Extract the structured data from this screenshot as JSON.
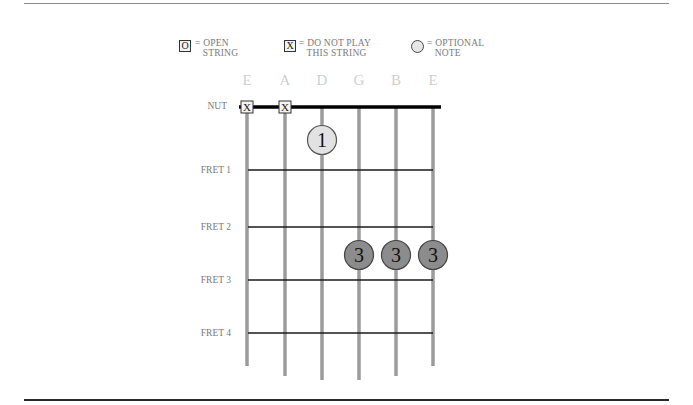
{
  "legend": {
    "open": {
      "symbol": "O",
      "text": "= OPEN\n   STRING"
    },
    "mute": {
      "symbol": "X",
      "text": "= DO NOT PLAY\n   THIS STRING"
    },
    "optional": {
      "symbol": "circle",
      "text": "= OPTIONAL\n   NOTE"
    }
  },
  "strings": [
    "E",
    "A",
    "D",
    "G",
    "B",
    "E"
  ],
  "nut_label": "NUT",
  "fret_labels": [
    "FRET 1",
    "FRET 2",
    "FRET 3",
    "FRET 4"
  ],
  "muted_strings": [
    0,
    1
  ],
  "muted_symbol": "X",
  "notes": [
    {
      "string": 2,
      "position": "between nut and fret 1",
      "finger": "1",
      "optional": true
    },
    {
      "string": 3,
      "position": "between fret 2 and fret 3",
      "finger": "3",
      "optional": false
    },
    {
      "string": 4,
      "position": "between fret 2 and fret 3",
      "finger": "3",
      "optional": false
    },
    {
      "string": 5,
      "position": "between fret 2 and fret 3",
      "finger": "3",
      "optional": false
    }
  ],
  "colors": {
    "string": "#9b9b9b",
    "fret": "#1a1a1a",
    "nut": "#000000",
    "optional_dot": "#e2e2e2",
    "finger_dot": "#8c8c8c",
    "label_faint": "#cfcfcf",
    "label": "#7a7a7a"
  }
}
